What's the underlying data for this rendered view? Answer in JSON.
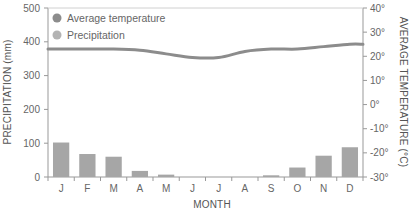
{
  "chart_data": {
    "type": "bar+line",
    "title": "",
    "xlabel": "MONTH",
    "ylabel": "PRECIPITATION (mm)",
    "y2label": "AVERAGE TEMPERATURE (°C)",
    "categories": [
      "J",
      "F",
      "M",
      "A",
      "M",
      "J",
      "J",
      "A",
      "S",
      "O",
      "N",
      "D"
    ],
    "ylim": [
      0,
      500
    ],
    "y2lim": [
      -30,
      40
    ],
    "yticks": [
      "0",
      "100",
      "200",
      "300",
      "400",
      "500"
    ],
    "y2ticks": [
      "-30°",
      "-20°",
      "-10°",
      "0°",
      "10°",
      "20°",
      "30°",
      "40°"
    ],
    "legend": [
      "Average temperature",
      "Precipitation"
    ],
    "legend_position": "top-left",
    "grid": false,
    "series": [
      {
        "name": "Precipitation",
        "type": "bar",
        "axis": "left",
        "color": "#a6a6a6",
        "values": [
          102,
          68,
          60,
          18,
          7,
          0,
          0,
          0,
          5,
          28,
          63,
          88
        ]
      },
      {
        "name": "Average temperature",
        "type": "line",
        "axis": "right",
        "color": "#8c8c8c",
        "values": [
          23,
          23,
          23,
          22.5,
          21,
          19.5,
          19.5,
          22,
          23,
          23,
          24,
          25
        ]
      }
    ]
  },
  "labels": {
    "legend_temp": "Average temperature",
    "legend_precip": "Precipitation",
    "xlabel": "MONTH",
    "ylabel": "PRECIPITATION (mm)",
    "y2label": "AVERAGE TEMPERATURE (°C)"
  },
  "colors": {
    "bar": "#a6a6a6",
    "line": "#8c8c8c",
    "axis": "#999999",
    "legend_temp": "#8c8c8c",
    "legend_precip": "#b3b3b3"
  }
}
